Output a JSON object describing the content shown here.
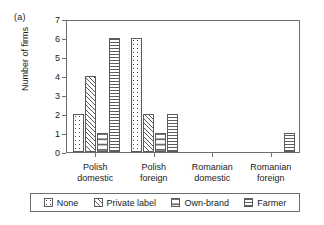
{
  "figure": {
    "panel_label": "(a)"
  },
  "chart_data": {
    "type": "bar",
    "title": "",
    "xlabel": "",
    "ylabel": "Number of firms",
    "ylim": [
      0,
      7
    ],
    "yticks": [
      0,
      1,
      2,
      3,
      4,
      5,
      6,
      7
    ],
    "grid": false,
    "legend_position": "below",
    "categories": [
      "Polish domestic",
      "Polish foreign",
      "Romanian domestic",
      "Romanian foreign"
    ],
    "category_lines": [
      [
        "Polish",
        "domestic"
      ],
      [
        "Polish",
        "foreign"
      ],
      [
        "Romanian",
        "domestic"
      ],
      [
        "Romanian",
        "foreign"
      ]
    ],
    "series": [
      {
        "name": "None",
        "pattern": "dots-fine",
        "values": [
          2,
          6,
          0,
          0
        ]
      },
      {
        "name": "Private label",
        "pattern": "diagonal-hatch",
        "values": [
          4,
          2,
          0,
          0
        ]
      },
      {
        "name": "Own-brand",
        "pattern": "dots-coarse",
        "values": [
          1,
          1,
          0,
          0
        ]
      },
      {
        "name": "Farmer",
        "pattern": "horizontal-lines",
        "values": [
          6,
          2,
          0,
          1
        ]
      }
    ]
  },
  "legend": {
    "items": [
      {
        "label": "None"
      },
      {
        "label": "Private label"
      },
      {
        "label": "Own-brand"
      },
      {
        "label": "Farmer"
      }
    ]
  },
  "colors": {
    "axis": "#6e6e6e",
    "bar_outline": "#5b5b5b",
    "text": "#1a1a1a",
    "background": "#ffffff"
  }
}
